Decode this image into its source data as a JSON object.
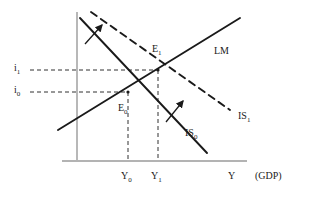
{
  "figure": {
    "type": "is-lm-diagram",
    "title": "",
    "background": "#ffffff",
    "ink_color": "#1a1a1a",
    "axis_color": "#9a9a9a",
    "width": 311,
    "height": 199
  },
  "axes": {
    "y_axis": {
      "name": "interest-rate-axis",
      "x": 77,
      "y_top": 12,
      "y_bottom": 160
    },
    "x_axis": {
      "name": "output-axis",
      "y": 161,
      "x_left": 62,
      "x_right": 247
    },
    "x_axis_label": "Y",
    "x_axis_unit": "(GDP)",
    "y_ticks": [
      {
        "id": "i1",
        "label": "i",
        "sub": "1",
        "y": 70,
        "label_x": 14,
        "label_y": 63
      },
      {
        "id": "i0",
        "label": "i",
        "sub": "0",
        "y": 92,
        "label_x": 14,
        "label_y": 85
      }
    ],
    "x_ticks": [
      {
        "id": "Y0",
        "label": "Y",
        "sub": "0",
        "x": 128,
        "label_x": 121,
        "label_y": 171
      },
      {
        "id": "Y1",
        "label": "Y",
        "sub": "1",
        "x": 158,
        "label_x": 151,
        "label_y": 171
      }
    ]
  },
  "curves": [
    {
      "id": "lm",
      "name": "lm-curve",
      "label": "LM",
      "style": "solid",
      "points": [
        [
          58,
          130
        ],
        [
          240,
          18
        ]
      ],
      "label_x": 214,
      "label_y": 46
    },
    {
      "id": "is0",
      "name": "is0-curve",
      "label": "IS",
      "sub": "0",
      "style": "solid",
      "points": [
        [
          80,
          18
        ],
        [
          207,
          153
        ]
      ],
      "label_x": 185,
      "label_y": 128
    },
    {
      "id": "is1",
      "name": "is1-curve",
      "label": "IS",
      "sub": "1",
      "style": "dashed",
      "points": [
        [
          91,
          12
        ],
        [
          230,
          110
        ]
      ],
      "label_x": 238,
      "label_y": 111
    }
  ],
  "equilibria": [
    {
      "id": "E0",
      "name": "equilibrium-e0",
      "label": "E",
      "sub": "0",
      "x": 128,
      "y": 92,
      "label_x": 118,
      "label_y": 103
    },
    {
      "id": "E1",
      "name": "equilibrium-e1",
      "label": "E",
      "sub": "1",
      "x": 158,
      "y": 70,
      "label_x": 152,
      "label_y": 44
    }
  ],
  "guides": [
    {
      "id": "g-i1",
      "name": "guide-i1",
      "orientation": "horizontal",
      "from": [
        30,
        70
      ],
      "to": [
        158,
        70
      ]
    },
    {
      "id": "g-i0",
      "name": "guide-i0",
      "orientation": "horizontal",
      "from": [
        30,
        92
      ],
      "to": [
        128,
        92
      ]
    },
    {
      "id": "g-Y0",
      "name": "guide-y0",
      "orientation": "vertical",
      "from": [
        128,
        92
      ],
      "to": [
        128,
        161
      ]
    },
    {
      "id": "g-Y1",
      "name": "guide-y1",
      "orientation": "vertical",
      "from": [
        158,
        70
      ],
      "to": [
        158,
        161
      ]
    }
  ],
  "shift_arrows": [
    {
      "id": "arrow-upper",
      "name": "shift-arrow-upper",
      "from": [
        85,
        44
      ],
      "to": [
        102,
        25
      ]
    },
    {
      "id": "arrow-lower",
      "name": "shift-arrow-lower",
      "from": [
        166,
        122
      ],
      "to": [
        183,
        101
      ]
    }
  ],
  "chart_data": {
    "type": "line",
    "xlabel": "Y  (GDP)",
    "ylabel": "i",
    "grid": false,
    "legend": "inline-curve-labels",
    "xtick_labels": [
      "Y0",
      "Y1"
    ],
    "ytick_labels": [
      "i0",
      "i1"
    ],
    "series": [
      {
        "name": "LM",
        "style": "solid",
        "slope": "positive",
        "points": [
          [
            58,
            130
          ],
          [
            240,
            18
          ]
        ]
      },
      {
        "name": "IS0",
        "style": "solid",
        "slope": "negative",
        "points": [
          [
            80,
            18
          ],
          [
            207,
            153
          ]
        ]
      },
      {
        "name": "IS1",
        "style": "dashed",
        "slope": "negative",
        "points": [
          [
            91,
            12
          ],
          [
            230,
            110
          ]
        ]
      }
    ],
    "annotations": [
      {
        "text": "E0",
        "at": [
          128,
          92
        ],
        "note": "initial equilibrium: IS0 x LM at (Y0, i0)"
      },
      {
        "text": "E1",
        "at": [
          158,
          70
        ],
        "note": "new equilibrium: IS1 x LM at (Y1, i1)"
      },
      {
        "text": "shift arrow",
        "at": [
          93,
          34
        ]
      },
      {
        "text": "shift arrow",
        "at": [
          174,
          111
        ]
      }
    ]
  }
}
